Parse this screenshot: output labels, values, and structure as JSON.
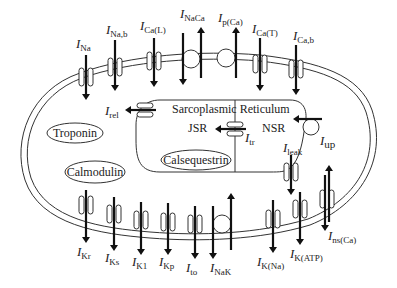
{
  "compartments": {
    "sr_label": "Sarcoplasmic Reticulum",
    "jsr_label": "JSR",
    "nsr_label": "NSR",
    "buffers": {
      "troponin": "Troponin",
      "calmodulin": "Calmodulin",
      "calsequestrin": "Calsequestrin"
    }
  },
  "top_currents": [
    {
      "id": "INa",
      "main": "I",
      "sub": "Na",
      "type": "channel",
      "direction": "in"
    },
    {
      "id": "INab",
      "main": "I",
      "sub": "Na,b",
      "type": "channel",
      "direction": "in"
    },
    {
      "id": "ICaL",
      "main": "I",
      "sub": "Ca(L)",
      "type": "channel",
      "direction": "in"
    },
    {
      "id": "INaCa",
      "main": "I",
      "sub": "NaCa",
      "type": "exchanger",
      "direction": "bidirectional"
    },
    {
      "id": "IpCa",
      "main": "I",
      "sub": "p(Ca)",
      "type": "pump",
      "direction": "out"
    },
    {
      "id": "ICaT",
      "main": "I",
      "sub": "Ca(T)",
      "type": "channel",
      "direction": "in"
    },
    {
      "id": "ICab",
      "main": "I",
      "sub": "Ca,b",
      "type": "channel",
      "direction": "in"
    }
  ],
  "bottom_currents": [
    {
      "id": "IKr",
      "main": "I",
      "sub": "Kr",
      "type": "channel",
      "direction": "out"
    },
    {
      "id": "IKs",
      "main": "I",
      "sub": "Ks",
      "type": "channel",
      "direction": "out"
    },
    {
      "id": "IK1",
      "main": "I",
      "sub": "K1",
      "type": "channel",
      "direction": "out"
    },
    {
      "id": "IKp",
      "main": "I",
      "sub": "Kp",
      "type": "channel",
      "direction": "out"
    },
    {
      "id": "Ito",
      "main": "I",
      "sub": "to",
      "type": "channel",
      "direction": "out"
    },
    {
      "id": "INaK",
      "main": "I",
      "sub": "NaK",
      "type": "pump",
      "direction": "bidirectional"
    },
    {
      "id": "IKNa",
      "main": "I",
      "sub": "K(Na)",
      "type": "channel",
      "direction": "out"
    },
    {
      "id": "IKATP",
      "main": "I",
      "sub": "K(ATP)",
      "type": "channel",
      "direction": "out"
    },
    {
      "id": "InsCa",
      "main": "I",
      "sub": "ns(Ca)",
      "type": "channel",
      "direction": "bidirectional"
    }
  ],
  "sr_currents": [
    {
      "id": "Irel",
      "main": "I",
      "sub": "rel"
    },
    {
      "id": "Itr",
      "main": "I",
      "sub": "tr"
    },
    {
      "id": "Iup",
      "main": "I",
      "sub": "up"
    },
    {
      "id": "Ileak",
      "main": "I",
      "sub": "leak"
    }
  ],
  "colors": {
    "line": "#333333",
    "arrow": "#111111",
    "background": "#ffffff"
  }
}
